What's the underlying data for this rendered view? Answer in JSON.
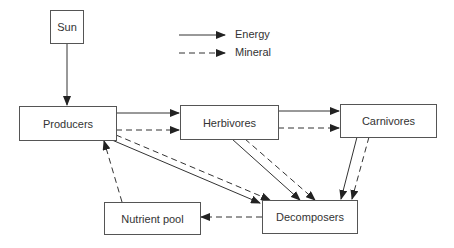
{
  "diagram": {
    "nodes": {
      "sun": "Sun",
      "producers": "Producers",
      "herbivores": "Herbivores",
      "carnivores": "Carnivores",
      "nutrient_pool": "Nutrient pool",
      "decomposers": "Decomposers"
    },
    "legend": {
      "energy": "Energy",
      "mineral": "Mineral"
    },
    "edges": [
      {
        "from": "Sun",
        "to": "Producers",
        "type": "Energy"
      },
      {
        "from": "Producers",
        "to": "Herbivores",
        "type": "Energy"
      },
      {
        "from": "Producers",
        "to": "Herbivores",
        "type": "Mineral"
      },
      {
        "from": "Herbivores",
        "to": "Carnivores",
        "type": "Energy"
      },
      {
        "from": "Herbivores",
        "to": "Carnivores",
        "type": "Mineral"
      },
      {
        "from": "Producers",
        "to": "Decomposers",
        "type": "Energy"
      },
      {
        "from": "Producers",
        "to": "Decomposers",
        "type": "Mineral"
      },
      {
        "from": "Herbivores",
        "to": "Decomposers",
        "type": "Energy"
      },
      {
        "from": "Herbivores",
        "to": "Decomposers",
        "type": "Mineral"
      },
      {
        "from": "Carnivores",
        "to": "Decomposers",
        "type": "Energy"
      },
      {
        "from": "Carnivores",
        "to": "Decomposers",
        "type": "Mineral"
      },
      {
        "from": "Decomposers",
        "to": "Nutrient pool",
        "type": "Mineral"
      },
      {
        "from": "Nutrient pool",
        "to": "Producers",
        "type": "Mineral"
      }
    ]
  }
}
